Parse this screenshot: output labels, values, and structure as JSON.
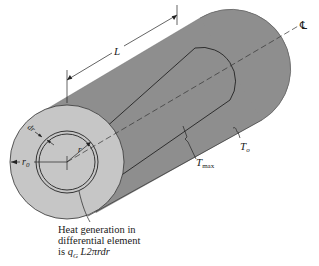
{
  "figure": {
    "type": "cylinder-heat-generation-diagram",
    "colors": {
      "background": "#ffffff",
      "front_face": "#c6c6c6",
      "body": "#8e8e8e",
      "line": "#222222"
    },
    "labels": {
      "length": "L",
      "centerline": "℄",
      "outer_radius": "r",
      "outer_radius_sub": "0",
      "radius": "r",
      "dr": "dr",
      "t_max": "T",
      "t_max_sub": "max",
      "t_o": "T",
      "t_o_sub": "o"
    },
    "caption": {
      "line1": "Heat generation in",
      "line2": "differential element",
      "line3_prefix": "is ",
      "line3_q": "q",
      "line3_sub": "G",
      "line3_rest": " L2πrdr"
    }
  }
}
